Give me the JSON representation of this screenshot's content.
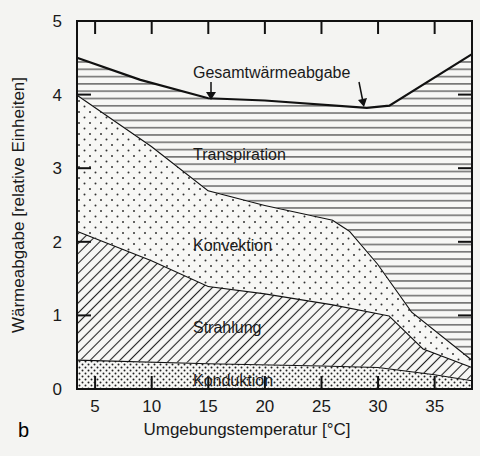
{
  "panel_label": "b",
  "chart_data": {
    "type": "area",
    "stacked": true,
    "title": "",
    "xlabel": "Umgebungstemperatur [°C]",
    "ylabel": "Wärmeabgabe [relative Einheiten]",
    "xlim": [
      3.4,
      38.3
    ],
    "ylim": [
      0,
      5
    ],
    "xticks": [
      5,
      10,
      15,
      20,
      25,
      30,
      35
    ],
    "yticks": [
      0,
      1,
      2,
      3,
      4,
      5
    ],
    "grid": false,
    "legend": "inline labels",
    "annotations": [
      "Gesamtwärmeabgabe",
      "Transpiration",
      "Konvektion",
      "Strahlung",
      "Konduktion"
    ],
    "series": [
      {
        "name": "Konduktion",
        "pattern": "dense dots",
        "upper_boundary": [
          [
            3.4,
            0.4
          ],
          [
            15,
            0.35
          ],
          [
            25,
            0.32
          ],
          [
            30,
            0.3
          ],
          [
            35,
            0.2
          ],
          [
            38.3,
            0.12
          ]
        ]
      },
      {
        "name": "Strahlung",
        "pattern": "diagonal hatch",
        "upper_boundary": [
          [
            3.4,
            2.15
          ],
          [
            10,
            1.75
          ],
          [
            15,
            1.4
          ],
          [
            20,
            1.3
          ],
          [
            26,
            1.15
          ],
          [
            31,
            1.0
          ],
          [
            34,
            0.55
          ],
          [
            38.3,
            0.3
          ]
        ]
      },
      {
        "name": "Konvektion",
        "pattern": "sparse dots",
        "upper_boundary": [
          [
            3.4,
            4.0
          ],
          [
            10,
            3.3
          ],
          [
            15,
            2.7
          ],
          [
            20,
            2.5
          ],
          [
            26,
            2.3
          ],
          [
            27.5,
            2.15
          ],
          [
            30,
            1.7
          ],
          [
            33,
            1.05
          ],
          [
            38.3,
            0.4
          ]
        ]
      },
      {
        "name": "Transpiration",
        "pattern": "horizontal lines",
        "upper_boundary": [
          [
            3.4,
            4.5
          ],
          [
            9,
            4.2
          ],
          [
            15,
            3.95
          ],
          [
            20,
            3.92
          ],
          [
            29,
            3.82
          ],
          [
            31,
            3.85
          ],
          [
            38.3,
            4.55
          ]
        ]
      }
    ],
    "total_label": "Gesamtwärmeabgabe",
    "total": [
      [
        3.4,
        4.5
      ],
      [
        9,
        4.2
      ],
      [
        15,
        3.95
      ],
      [
        20,
        3.92
      ],
      [
        29,
        3.82
      ],
      [
        31,
        3.85
      ],
      [
        38.3,
        4.55
      ]
    ]
  }
}
